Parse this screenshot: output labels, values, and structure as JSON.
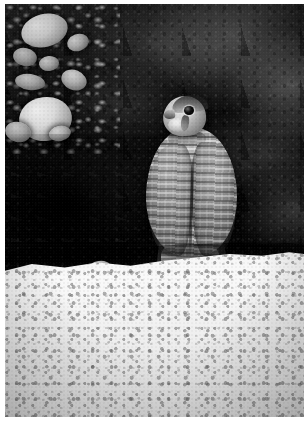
{
  "image": {
    "title": "Falcon perched on rock ledge",
    "description": "Black and white photograph of a falcon perched on a pale rocky ledge in front of a dark shadowed cliff face",
    "orientation": "portrait",
    "color_mode": "black-and-white",
    "width_px": 308,
    "height_px": 421,
    "border": {
      "color": "#ffffff",
      "left_px": 5,
      "top_px": 4,
      "right_px": 4,
      "bottom_px": 4
    }
  },
  "subject": {
    "name": "falcon",
    "common_name": "Prairie Falcon",
    "pose": "perched, facing away, head turned to the left over shoulder",
    "parts": {
      "head": "head",
      "eye": "dark eye",
      "beak": "hooked beak",
      "crown": "dark crown",
      "malar_stripe": "dark malar stripe",
      "cheek": "pale cheek patch",
      "nape": "nape",
      "body": "barred back and folded wings",
      "wing_left": "left folded wing",
      "wing_right": "right folded wing",
      "belly": "lower flank",
      "tail": "barred tail",
      "primaries": "dark primary feather tips"
    }
  },
  "scene": {
    "background": "dark rocky cliff face in shadow",
    "foreground": "bright pale speckled rock ledge",
    "upper_left": "cluster of bright sunlit boulders and rubble",
    "mid_left": "deep shadowed crevice",
    "ledge_stones": "scattered rounded stones along the ledge lip"
  },
  "palette": {
    "frame": "#ffffff",
    "wall_dark": "#0c0b0a",
    "wall_mid": "#2a2927",
    "ledge_light": "#f4f2ed",
    "ledge_shadow": "#dcd9d2",
    "boulder_highlight": "#f2f0ec",
    "plumage_light": "#e7e4de",
    "plumage_dark": "#3a3835"
  }
}
